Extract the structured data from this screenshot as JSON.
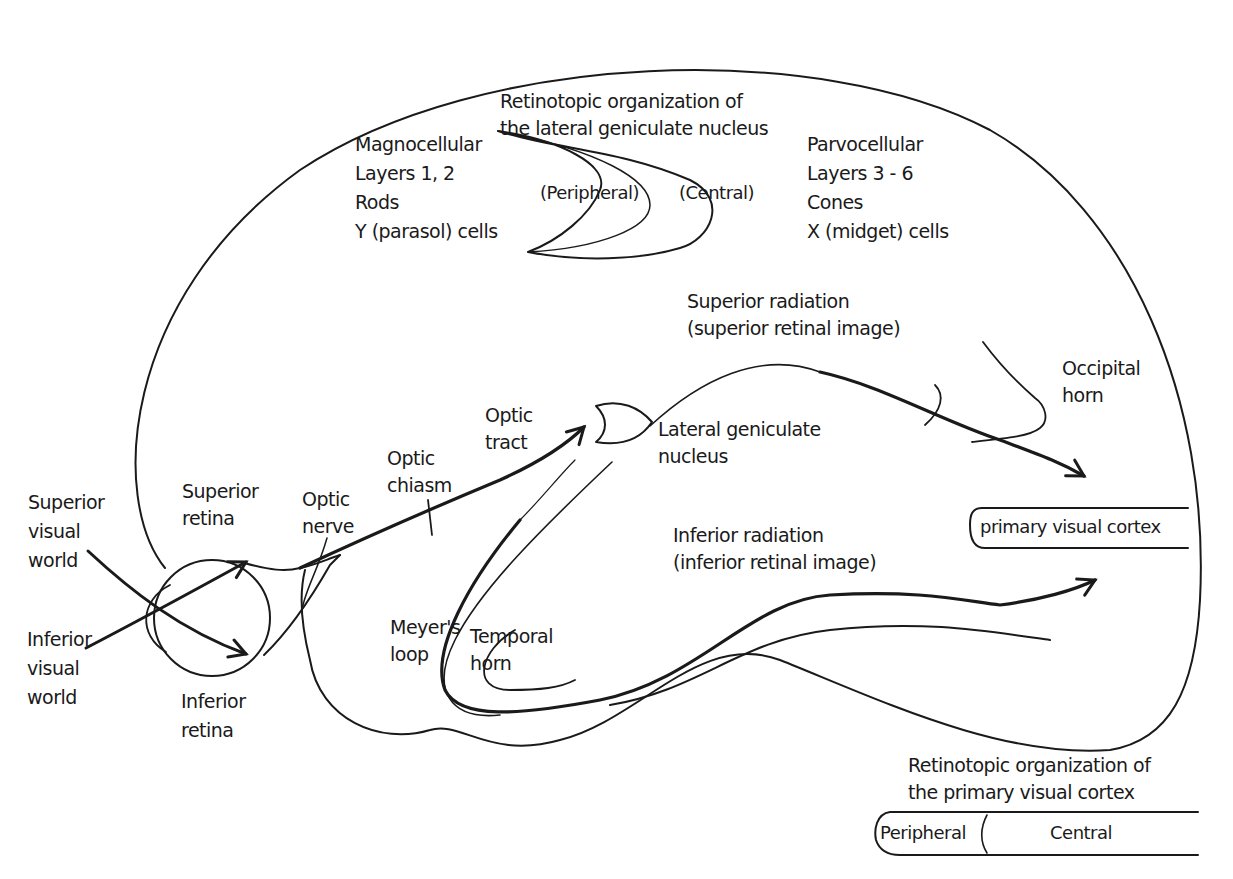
{
  "diagram": {
    "type": "anatomical-pathway",
    "labels": {
      "lgn_title": "Retinotopic organization of\nthe lateral geniculate nucleus",
      "magnocellular": "Magnocellular\nLayers 1, 2\nRods\nY (parasol) cells",
      "parvocellular": "Parvocellular\nLayers 3 - 6\nCones\nX (midget) cells",
      "lgn_peripheral": "(Peripheral)",
      "lgn_central": "(Central)",
      "superior_radiation": "Superior radiation\n(superior retinal image)",
      "occipital_horn": "Occipital\nhorn",
      "optic_tract": "Optic\ntract",
      "lateral_geniculate_nucleus": "Lateral geniculate\nnucleus",
      "optic_chiasm": "Optic\nchiasm",
      "optic_nerve": "Optic\nnerve",
      "superior_retina": "Superior\nretina",
      "superior_visual_world": "Superior\nvisual\nworld",
      "inferior_visual_world": "Inferior\nvisual\nworld",
      "inferior_retina": "Inferior\nretina",
      "primary_visual_cortex": "primary visual cortex",
      "inferior_radiation": "Inferior radiation\n(inferior retinal image)",
      "meyers_loop": "Meyer's\nloop",
      "temporal_horn": "Temporal\nhorn",
      "v1_title": "Retinotopic organization of\nthe primary visual cortex",
      "v1_peripheral": "Peripheral",
      "v1_central": "Central"
    },
    "colors": {
      "ink": "#1a1a1a",
      "background": "#ffffff"
    }
  }
}
